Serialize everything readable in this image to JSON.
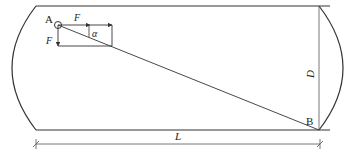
{
  "diagram": {
    "points": {
      "A": "A",
      "B": "B"
    },
    "forces": {
      "horizontal": "F",
      "vertical": "F",
      "angle": "α"
    },
    "dimensions": {
      "length": "L",
      "diameter": "D"
    },
    "colors": {
      "stroke": "#333333",
      "background": "#ffffff"
    }
  }
}
